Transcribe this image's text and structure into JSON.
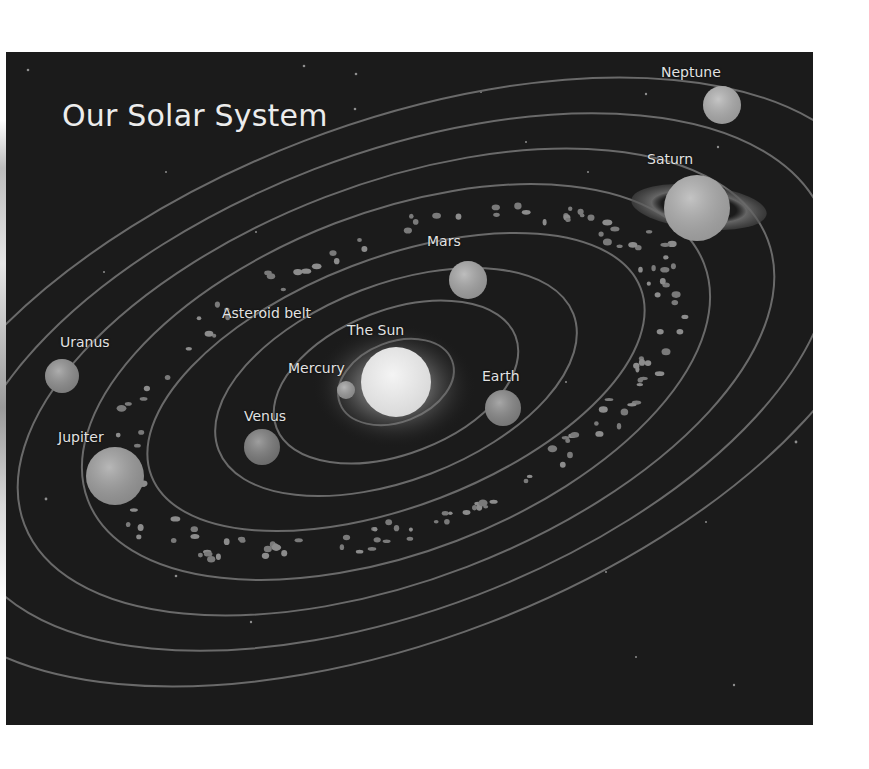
{
  "title": "Our Solar System",
  "colors": {
    "background": "#1b1b1b",
    "orbit": "#6a6a6a",
    "label": "#e2e2e2",
    "sun": "#e8e8e8",
    "sun_glow": "#8c8c8c"
  },
  "sun": {
    "label": "The Sun",
    "cx": 390,
    "cy": 330,
    "r": 35
  },
  "planets": [
    {
      "name": "Mercury",
      "cx": 340,
      "cy": 338,
      "r": 9,
      "fill": "#9e9e9e"
    },
    {
      "name": "Venus",
      "cx": 256,
      "cy": 395,
      "r": 18,
      "fill": "#7e7e7e"
    },
    {
      "name": "Earth",
      "cx": 497,
      "cy": 356,
      "r": 18,
      "fill": "#8a8a8a"
    },
    {
      "name": "Mars",
      "cx": 462,
      "cy": 228,
      "r": 19,
      "fill": "#a8a8a8"
    },
    {
      "name": "Jupiter",
      "cx": 109,
      "cy": 424,
      "r": 29,
      "fill": "#a0a0a0"
    },
    {
      "name": "Saturn",
      "cx": 691,
      "cy": 156,
      "r": 33,
      "fill": "#b0b0b0"
    },
    {
      "name": "Uranus",
      "cx": 56,
      "cy": 324,
      "r": 17,
      "fill": "#929292"
    },
    {
      "name": "Neptune",
      "cx": 716,
      "cy": 53,
      "r": 19,
      "fill": "#b2b2b2"
    }
  ],
  "labels": [
    {
      "text": "Neptune",
      "x": 655,
      "y": 12
    },
    {
      "text": "Saturn",
      "x": 641,
      "y": 99
    },
    {
      "text": "Mars",
      "x": 421,
      "y": 181
    },
    {
      "text": "Asteroid belt",
      "x": 216,
      "y": 253
    },
    {
      "text": "The Sun",
      "x": 341,
      "y": 270
    },
    {
      "text": "Uranus",
      "x": 54,
      "y": 282
    },
    {
      "text": "Mercury",
      "x": 282,
      "y": 308
    },
    {
      "text": "Earth",
      "x": 476,
      "y": 316
    },
    {
      "text": "Venus",
      "x": 238,
      "y": 356
    },
    {
      "text": "Jupiter",
      "x": 52,
      "y": 377
    }
  ],
  "asteroid_belt": {
    "label": "Asteroid belt"
  }
}
